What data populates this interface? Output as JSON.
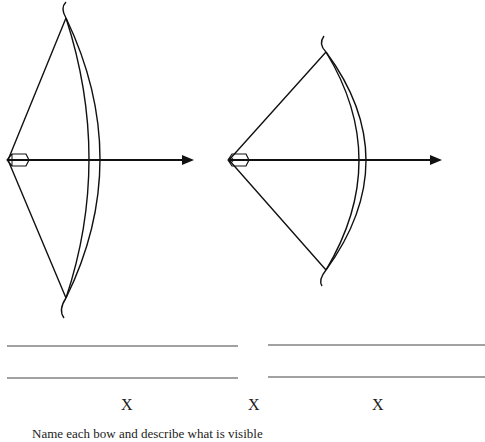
{
  "figure": {
    "bows": [
      {
        "label": "full-draw bow",
        "top_tip": [
          66,
          15
        ],
        "bottom_tip": [
          66,
          300
        ],
        "nock": [
          8,
          160
        ],
        "arrow_tip_x": 192
      },
      {
        "label": "partial-draw bow",
        "top_tip": [
          326,
          50
        ],
        "bottom_tip": [
          326,
          272
        ],
        "nock": [
          229,
          160
        ],
        "arrow_tip_x": 440
      }
    ],
    "answer_lines": {
      "left": {
        "x1": 7,
        "x2": 238,
        "y": [
          346,
          378
        ]
      },
      "right": {
        "x1": 268,
        "x2": 485,
        "y": [
          345,
          377
        ]
      }
    },
    "marks": [
      {
        "text": "X",
        "x": 121
      },
      {
        "text": "X",
        "x": 248
      },
      {
        "text": "X",
        "x": 372
      }
    ],
    "caption": "Name each bow and describe what is visible"
  }
}
